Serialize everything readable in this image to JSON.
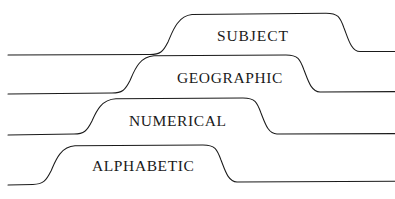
{
  "diagram": {
    "type": "stepped-tab-outline-drawing",
    "background_color": "#ffffff",
    "stroke_color": "#1a1a1a",
    "text_color": "#1a1a1a",
    "canvas": {
      "width": 395,
      "height": 199
    },
    "tabs": [
      {
        "id": "subject",
        "label": "SUBJECT",
        "order": 1,
        "position": "top",
        "left_baseline_y": 54,
        "right_baseline_y": 52,
        "plateau_y": 14,
        "left_rise_x": [
          160,
          182
        ],
        "right_fall_x": [
          338,
          356
        ],
        "label_x": 217,
        "label_y": 28
      },
      {
        "id": "geographic",
        "label": "GEOGRAPHIC",
        "order": 2,
        "position": "second",
        "left_baseline_y": 93,
        "right_baseline_y": 92,
        "plateau_y": 57,
        "left_rise_x": [
          120,
          145
        ],
        "right_fall_x": [
          295,
          318
        ],
        "label_x": 177,
        "label_y": 70
      },
      {
        "id": "numerical",
        "label": "NUMERICAL",
        "order": 3,
        "position": "third",
        "left_baseline_y": 134,
        "right_baseline_y": 134,
        "plateau_y": 100,
        "left_rise_x": [
          82,
          107
        ],
        "right_fall_x": [
          250,
          275
        ],
        "label_x": 129,
        "label_y": 113
      },
      {
        "id": "alphabetic",
        "label": "ALPHABETIC",
        "order": 4,
        "position": "bottom",
        "left_baseline_y": 184,
        "right_baseline_y": 182,
        "plateau_y": 146,
        "left_rise_x": [
          40,
          66
        ],
        "right_fall_x": [
          210,
          234
        ],
        "label_x": 92,
        "label_y": 158
      }
    ]
  }
}
